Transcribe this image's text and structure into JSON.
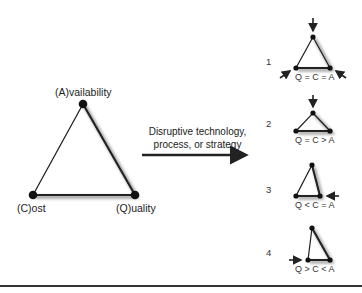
{
  "main_triangle": {
    "labels": {
      "top": "(A)vailability",
      "left": "(C)ost",
      "right": "(Q)uality"
    }
  },
  "transition": {
    "caption_line1": "Disruptive technology,",
    "caption_line2": "process, or strategy"
  },
  "scenarios": [
    {
      "number": "1",
      "relation": "Q = C = A"
    },
    {
      "number": "2",
      "relation": "Q = C > A"
    },
    {
      "number": "3",
      "relation": "Q < C = A"
    },
    {
      "number": "4",
      "relation": "Q > C < A"
    }
  ],
  "colors": {
    "line": "#222222",
    "shadow": "#9a9a9a"
  }
}
